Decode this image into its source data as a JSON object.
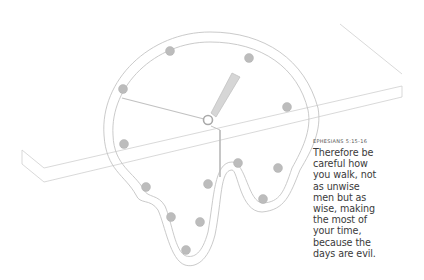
{
  "illustration": {
    "subject": "melting clock draped over table edge",
    "colors": {
      "stroke": "#c4c4c4",
      "dot": "#b8b8b8",
      "hand": "#bdbdbd",
      "background": "#ffffff"
    }
  },
  "verse": {
    "reference": "EPHESIANS 5:15-16",
    "lines": [
      "Therefore be",
      "careful how",
      "you walk, not",
      "as unwise",
      "men but as",
      "wise, making",
      "the most of",
      "your time,",
      "because the",
      "days are evil."
    ]
  }
}
